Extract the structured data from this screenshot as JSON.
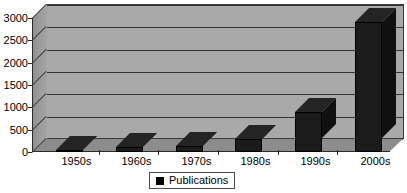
{
  "chart_data": {
    "type": "bar",
    "title": "",
    "subtitle": "",
    "xlabel": "",
    "ylabel": "",
    "categories": [
      "1950s",
      "1960s",
      "1970s",
      "1980s",
      "1990s",
      "2000s"
    ],
    "series": [
      {
        "name": "Publications",
        "values": [
          30,
          110,
          130,
          280,
          900,
          2900
        ],
        "color": "#1b1b1b"
      }
    ],
    "ylim": [
      0,
      3000
    ],
    "yticks": [
      0,
      500,
      1000,
      1500,
      2000,
      2500,
      3000
    ],
    "ytick_labels": [
      "0",
      "500",
      "1000",
      "1500",
      "2000",
      "2500",
      "3000"
    ],
    "grid": true,
    "grid_axis": "y",
    "legend": {
      "position": "bottom",
      "entries": [
        {
          "label": "Publications",
          "marker": "square",
          "color": "#000000"
        }
      ]
    },
    "style": {
      "three_d": true,
      "plot_background": "#a9a9a9",
      "floor_color": "#8c8c8c",
      "gridline_color": "#333333",
      "axis_color": "#2b2b2b",
      "text_color": "#000000"
    }
  },
  "legend": {
    "publications_label": "Publications"
  },
  "axis": {
    "y_labels": [
      "3000",
      "2500",
      "2000",
      "1500",
      "1000",
      "500",
      "0"
    ],
    "x_labels": [
      "1950s",
      "1960s",
      "1970s",
      "1980s",
      "1990s",
      "2000s"
    ]
  }
}
